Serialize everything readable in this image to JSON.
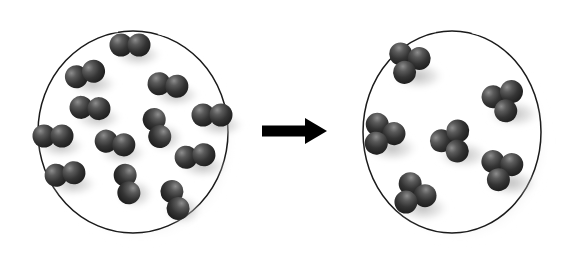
{
  "figure": {
    "title": "Molecular reaction diagram: diatomic molecules converting to triatomic molecules",
    "background_color": "#ffffff",
    "arrow_color": "#000000",
    "container_stroke_color": "#1a1a1a",
    "container_fill_color": "#ffffff",
    "sphere_color_dark": "#2b2b2b",
    "sphere_color_mid": "#4a4a4a",
    "sphere_color_highlight": "#8d8d8d",
    "shadow_color": "#c9c9c9"
  },
  "arrow": {
    "label": "reaction-arrow",
    "direction": "right",
    "x_start": 262,
    "x_end": 327,
    "y_center": 131,
    "shaft_thickness": 11,
    "head_width": 20,
    "head_height": 26
  },
  "panels": [
    {
      "id": "reactants",
      "name": "left-container",
      "label": "Reactant vessel",
      "center_x": 133,
      "center_y": 132,
      "radius_x": 95,
      "radius_y": 101,
      "molecule_type": "diatomic",
      "atoms_per_molecule": 2,
      "molecule_count": 12,
      "atom_radius": 11,
      "molecules": [
        {
          "x": 130,
          "y": 45,
          "angle": 0,
          "name": "molecule-1"
        },
        {
          "x": 85,
          "y": 74,
          "angle": -18,
          "name": "molecule-2"
        },
        {
          "x": 168,
          "y": 85,
          "angle": 8,
          "name": "molecule-3"
        },
        {
          "x": 90,
          "y": 108,
          "angle": 4,
          "name": "molecule-4"
        },
        {
          "x": 212,
          "y": 115,
          "angle": 0,
          "name": "molecule-5"
        },
        {
          "x": 53,
          "y": 136,
          "angle": 0,
          "name": "molecule-6"
        },
        {
          "x": 115,
          "y": 143,
          "angle": 12,
          "name": "molecule-7"
        },
        {
          "x": 157,
          "y": 128,
          "angle": 72,
          "name": "molecule-8"
        },
        {
          "x": 195,
          "y": 156,
          "angle": -8,
          "name": "molecule-9"
        },
        {
          "x": 65,
          "y": 174,
          "angle": -8,
          "name": "molecule-10"
        },
        {
          "x": 127,
          "y": 184,
          "angle": 78,
          "name": "molecule-11"
        },
        {
          "x": 175,
          "y": 200,
          "angle": 70,
          "name": "molecule-12"
        }
      ]
    },
    {
      "id": "products",
      "name": "right-container",
      "label": "Product vessel",
      "center_x": 452,
      "center_y": 132,
      "radius_x": 89,
      "radius_y": 101,
      "molecule_type": "triatomic",
      "atoms_per_molecule": 3,
      "molecule_count": 6,
      "atom_radius": 11,
      "molecules": [
        {
          "x": 408,
          "y": 63,
          "angle": 20,
          "name": "molecule-1"
        },
        {
          "x": 504,
          "y": 101,
          "angle": -10,
          "name": "molecule-2"
        },
        {
          "x": 382,
          "y": 135,
          "angle": 35,
          "name": "molecule-3"
        },
        {
          "x": 453,
          "y": 142,
          "angle": -25,
          "name": "molecule-4"
        },
        {
          "x": 501,
          "y": 170,
          "angle": 15,
          "name": "molecule-5"
        },
        {
          "x": 413,
          "y": 195,
          "angle": 45,
          "name": "molecule-6"
        }
      ]
    }
  ]
}
